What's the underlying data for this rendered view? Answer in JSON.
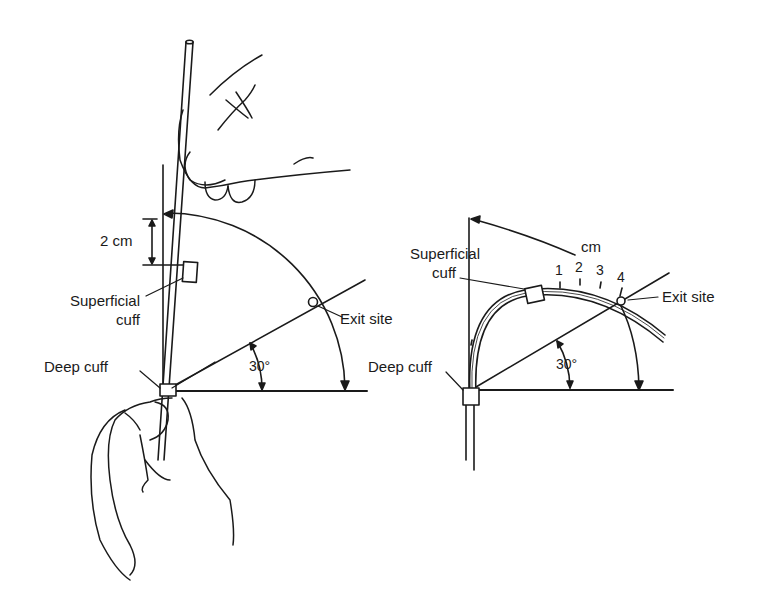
{
  "left_panel": {
    "length_label": "2 cm",
    "superficial_cuff_label_1": "Superficial",
    "superficial_cuff_label_2": "cuff",
    "exit_site_label": "Exit site",
    "angle_label": "30°",
    "deep_cuff_label": "Deep cuff"
  },
  "right_panel": {
    "unit_label": "cm",
    "ticks": [
      "1",
      "2",
      "3",
      "4"
    ],
    "superficial_cuff_label_1": "Superficial",
    "superficial_cuff_label_2": "cuff",
    "exit_site_label": "Exit site",
    "angle_label": "30°",
    "deep_cuff_label": "Deep cuff"
  },
  "colors": {
    "ink": "#1a1a1a",
    "background": "#ffffff"
  }
}
